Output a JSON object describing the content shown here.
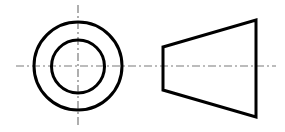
{
  "drawing": {
    "type": "orthographic-projection",
    "subject": "truncated cone (frustum) with through-hole",
    "colors": {
      "visible_line": "#000000",
      "center_line": "#7a7a7a",
      "background": "#ffffff"
    },
    "front_view": {
      "center": [
        78,
        66
      ],
      "outer_circle_radius": 44,
      "inner_circle_radius": 27
    },
    "side_view": {
      "shape": "trapezoid",
      "points": [
        [
          163,
          47
        ],
        [
          256,
          20
        ],
        [
          256,
          117
        ],
        [
          163,
          90
        ]
      ]
    },
    "center_lines": {
      "horizontal": {
        "x1": 16,
        "x2": 276,
        "y": 66
      },
      "vertical": {
        "x": 78,
        "y1": 5,
        "y2": 127
      }
    }
  }
}
